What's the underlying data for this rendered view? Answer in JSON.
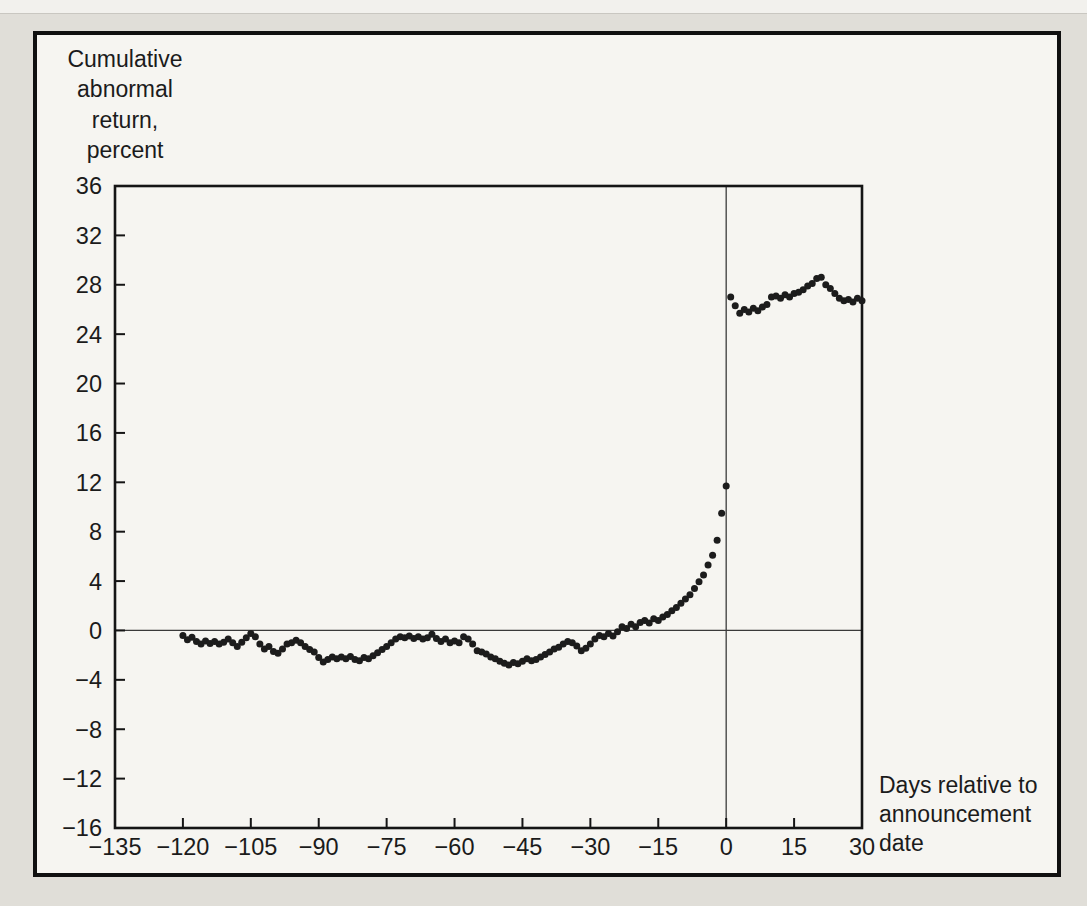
{
  "figure": {
    "page_background": "#e0ded8",
    "panel_background": "#f6f5f1",
    "panel_border_color": "#101010",
    "point_color": "#1c1c1c",
    "axis_color": "#151515"
  },
  "chart_data": {
    "type": "scatter",
    "title": "",
    "ylabel": "Cumulative\nabnormal\nreturn,\npercent",
    "xlabel": "Days relative to\nannouncement\ndate",
    "xlim": [
      -135,
      30
    ],
    "ylim": [
      -16,
      36
    ],
    "x_ticks": [
      -135,
      -120,
      -105,
      -90,
      -75,
      -60,
      -45,
      -30,
      -15,
      0,
      15,
      30
    ],
    "y_ticks": [
      36,
      32,
      28,
      24,
      20,
      16,
      12,
      8,
      4,
      0,
      -4,
      -8,
      -12,
      -16
    ],
    "grid": false,
    "legend": "none",
    "reference_lines": {
      "horizontal_y": 0,
      "vertical_x": 0
    },
    "series": [
      {
        "name": "Cumulative abnormal return (%)",
        "points": [
          [
            -120,
            -0.4
          ],
          [
            -119,
            -0.75
          ],
          [
            -118,
            -0.55
          ],
          [
            -117,
            -0.9
          ],
          [
            -116,
            -1.1
          ],
          [
            -115,
            -0.85
          ],
          [
            -114,
            -1.05
          ],
          [
            -113,
            -0.9
          ],
          [
            -112,
            -1.1
          ],
          [
            -111,
            -0.95
          ],
          [
            -110,
            -0.7
          ],
          [
            -109,
            -1.0
          ],
          [
            -108,
            -1.3
          ],
          [
            -107,
            -0.95
          ],
          [
            -106,
            -0.6
          ],
          [
            -105,
            -0.25
          ],
          [
            -104,
            -0.5
          ],
          [
            -103,
            -1.1
          ],
          [
            -102,
            -1.5
          ],
          [
            -101,
            -1.3
          ],
          [
            -100,
            -1.7
          ],
          [
            -99,
            -1.85
          ],
          [
            -98,
            -1.5
          ],
          [
            -97,
            -1.1
          ],
          [
            -96,
            -1.0
          ],
          [
            -95,
            -0.8
          ],
          [
            -94,
            -1.0
          ],
          [
            -93,
            -1.3
          ],
          [
            -92,
            -1.55
          ],
          [
            -91,
            -1.75
          ],
          [
            -90,
            -2.2
          ],
          [
            -89,
            -2.55
          ],
          [
            -88,
            -2.35
          ],
          [
            -87,
            -2.15
          ],
          [
            -86,
            -2.3
          ],
          [
            -85,
            -2.15
          ],
          [
            -84,
            -2.3
          ],
          [
            -83,
            -2.1
          ],
          [
            -82,
            -2.35
          ],
          [
            -81,
            -2.45
          ],
          [
            -80,
            -2.2
          ],
          [
            -79,
            -2.3
          ],
          [
            -78,
            -2.05
          ],
          [
            -77,
            -1.8
          ],
          [
            -76,
            -1.55
          ],
          [
            -75,
            -1.3
          ],
          [
            -74,
            -1.0
          ],
          [
            -73,
            -0.7
          ],
          [
            -72,
            -0.5
          ],
          [
            -71,
            -0.6
          ],
          [
            -70,
            -0.45
          ],
          [
            -69,
            -0.65
          ],
          [
            -68,
            -0.5
          ],
          [
            -67,
            -0.7
          ],
          [
            -66,
            -0.6
          ],
          [
            -65,
            -0.3
          ],
          [
            -64,
            -0.65
          ],
          [
            -63,
            -0.9
          ],
          [
            -62,
            -0.7
          ],
          [
            -61,
            -1.0
          ],
          [
            -60,
            -0.85
          ],
          [
            -59,
            -1.0
          ],
          [
            -58,
            -0.5
          ],
          [
            -57,
            -0.7
          ],
          [
            -56,
            -1.1
          ],
          [
            -55,
            -1.65
          ],
          [
            -54,
            -1.75
          ],
          [
            -53,
            -1.9
          ],
          [
            -52,
            -2.15
          ],
          [
            -51,
            -2.3
          ],
          [
            -50,
            -2.5
          ],
          [
            -49,
            -2.65
          ],
          [
            -48,
            -2.8
          ],
          [
            -47,
            -2.6
          ],
          [
            -46,
            -2.7
          ],
          [
            -45,
            -2.5
          ],
          [
            -44,
            -2.3
          ],
          [
            -43,
            -2.45
          ],
          [
            -42,
            -2.35
          ],
          [
            -41,
            -2.15
          ],
          [
            -40,
            -1.95
          ],
          [
            -39,
            -1.75
          ],
          [
            -38,
            -1.5
          ],
          [
            -37,
            -1.35
          ],
          [
            -36,
            -1.1
          ],
          [
            -35,
            -0.9
          ],
          [
            -34,
            -1.0
          ],
          [
            -33,
            -1.25
          ],
          [
            -32,
            -1.65
          ],
          [
            -31,
            -1.45
          ],
          [
            -30,
            -1.1
          ],
          [
            -29,
            -0.7
          ],
          [
            -28,
            -0.4
          ],
          [
            -27,
            -0.5
          ],
          [
            -26,
            -0.25
          ],
          [
            -25,
            -0.45
          ],
          [
            -24,
            -0.1
          ],
          [
            -23,
            0.3
          ],
          [
            -22,
            0.15
          ],
          [
            -21,
            0.5
          ],
          [
            -20,
            0.3
          ],
          [
            -19,
            0.65
          ],
          [
            -18,
            0.8
          ],
          [
            -17,
            0.6
          ],
          [
            -16,
            0.95
          ],
          [
            -15,
            0.8
          ],
          [
            -14,
            1.1
          ],
          [
            -13,
            1.3
          ],
          [
            -12,
            1.6
          ],
          [
            -11,
            1.85
          ],
          [
            -10,
            2.2
          ],
          [
            -9,
            2.55
          ],
          [
            -8,
            2.9
          ],
          [
            -7,
            3.4
          ],
          [
            -6,
            3.95
          ],
          [
            -5,
            4.5
          ],
          [
            -4,
            5.3
          ],
          [
            -3,
            6.1
          ],
          [
            -2,
            7.3
          ],
          [
            -1,
            9.5
          ],
          [
            0,
            11.7
          ],
          [
            1,
            27.0
          ],
          [
            2,
            26.3
          ],
          [
            3,
            25.7
          ],
          [
            4,
            26.0
          ],
          [
            5,
            25.8
          ],
          [
            6,
            26.1
          ],
          [
            7,
            25.9
          ],
          [
            8,
            26.2
          ],
          [
            9,
            26.4
          ],
          [
            10,
            27.0
          ],
          [
            11,
            27.1
          ],
          [
            12,
            26.9
          ],
          [
            13,
            27.2
          ],
          [
            14,
            27.0
          ],
          [
            15,
            27.3
          ],
          [
            16,
            27.4
          ],
          [
            17,
            27.6
          ],
          [
            18,
            27.9
          ],
          [
            19,
            28.1
          ],
          [
            20,
            28.5
          ],
          [
            21,
            28.6
          ],
          [
            22,
            28.0
          ],
          [
            23,
            27.7
          ],
          [
            24,
            27.3
          ],
          [
            25,
            26.9
          ],
          [
            26,
            26.7
          ],
          [
            27,
            26.8
          ],
          [
            28,
            26.6
          ],
          [
            29,
            26.9
          ],
          [
            30,
            26.7
          ]
        ]
      }
    ]
  }
}
